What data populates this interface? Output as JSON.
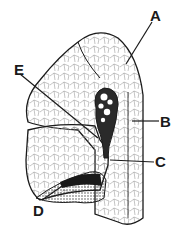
{
  "diagram": {
    "type": "anatomical-section-drawing",
    "labels": [
      {
        "id": "A",
        "text": "A",
        "x": 150,
        "y": 8
      },
      {
        "id": "B",
        "text": "B",
        "x": 160,
        "y": 115
      },
      {
        "id": "C",
        "text": "C",
        "x": 155,
        "y": 155
      },
      {
        "id": "D",
        "text": "D",
        "x": 33,
        "y": 203
      },
      {
        "id": "E",
        "text": "E",
        "x": 14,
        "y": 62
      }
    ],
    "colors": {
      "ink": "#1a1a1a",
      "fill": "#ffffff",
      "stipple": "#555555"
    }
  }
}
